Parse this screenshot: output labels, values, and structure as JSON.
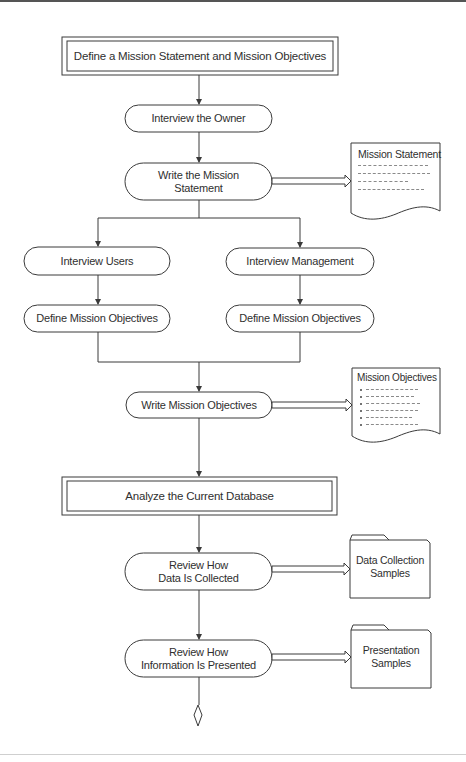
{
  "diagram": {
    "colors": {
      "stroke": "#3a3a3a",
      "text": "#2f2f2f",
      "background": "#ffffff"
    },
    "phases": [
      {
        "id": "phase1",
        "label": "Define a Mission Statement and Mission Objectives"
      },
      {
        "id": "phase2",
        "label": "Analyze the Current Database"
      }
    ],
    "activities": [
      {
        "id": "interview_owner",
        "label": "Interview the Owner"
      },
      {
        "id": "write_statement",
        "label": "Write the Mission\nStatement"
      },
      {
        "id": "interview_users",
        "label": "Interview Users"
      },
      {
        "id": "interview_mgmt",
        "label": "Interview Management"
      },
      {
        "id": "define_obj_left",
        "label": "Define Mission Objectives"
      },
      {
        "id": "define_obj_right",
        "label": "Define Mission Objectives"
      },
      {
        "id": "write_objectives",
        "label": "Write Mission Objectives"
      },
      {
        "id": "review_collected",
        "label": "Review How\nData Is Collected"
      },
      {
        "id": "review_presented",
        "label": "Review How\nInformation Is Presented"
      }
    ],
    "documents": [
      {
        "id": "doc_statement",
        "label": "Mission Statement",
        "type": "document-text"
      },
      {
        "id": "doc_objectives",
        "label": "Mission Objectives",
        "type": "document-bullets"
      }
    ],
    "folders": [
      {
        "id": "folder_collection",
        "label": "Data Collection\nSamples"
      },
      {
        "id": "folder_presentation",
        "label": "Presentation\nSamples"
      }
    ],
    "connectors": [
      {
        "from": "phase1",
        "to": "interview_owner",
        "type": "arrow"
      },
      {
        "from": "interview_owner",
        "to": "write_statement",
        "type": "arrow"
      },
      {
        "from": "write_statement",
        "to": "doc_statement",
        "type": "output-arrow"
      },
      {
        "from": "write_statement",
        "to": "interview_users",
        "type": "arrow"
      },
      {
        "from": "write_statement",
        "to": "interview_mgmt",
        "type": "arrow"
      },
      {
        "from": "interview_users",
        "to": "define_obj_left",
        "type": "arrow"
      },
      {
        "from": "interview_mgmt",
        "to": "define_obj_right",
        "type": "arrow"
      },
      {
        "from": "define_obj_left",
        "to": "write_objectives",
        "type": "merge-arrow"
      },
      {
        "from": "define_obj_right",
        "to": "write_objectives",
        "type": "merge-arrow"
      },
      {
        "from": "write_objectives",
        "to": "doc_objectives",
        "type": "output-arrow"
      },
      {
        "from": "write_objectives",
        "to": "phase2",
        "type": "arrow"
      },
      {
        "from": "phase2",
        "to": "review_collected",
        "type": "arrow"
      },
      {
        "from": "review_collected",
        "to": "folder_collection",
        "type": "output-arrow"
      },
      {
        "from": "review_collected",
        "to": "review_presented",
        "type": "arrow"
      },
      {
        "from": "review_presented",
        "to": "folder_presentation",
        "type": "output-arrow"
      },
      {
        "from": "review_presented",
        "to": "continuation",
        "type": "diamond-end"
      }
    ]
  }
}
